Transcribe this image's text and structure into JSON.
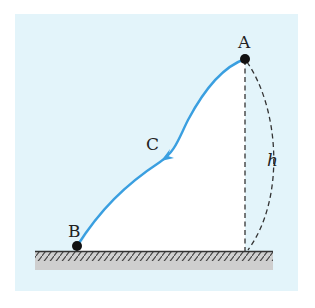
{
  "diagram": {
    "title": "",
    "colors": {
      "panel_background": "#e3f4fa",
      "region_fill": "#ffffff",
      "path_color": "#3a9fe0",
      "point_color": "#111111",
      "dashed_color": "#333333",
      "ground_fill": "#c9c9c9",
      "ground_line": "#333333"
    },
    "points": [
      {
        "id": "A",
        "label": "A",
        "x": 245,
        "y": 59,
        "position": "start, top of path"
      },
      {
        "id": "C",
        "label": "C",
        "x": 163,
        "y": 155,
        "position": "mid-path, arrow direction toward B"
      },
      {
        "id": "B",
        "label": "B",
        "x": 77,
        "y": 246,
        "position": "end, on ground"
      }
    ],
    "height_label": "h",
    "path": {
      "from": "A",
      "via": "C",
      "to": "B",
      "direction_arrow_at": "C"
    },
    "ground": {
      "label": "",
      "hatched": true
    }
  }
}
